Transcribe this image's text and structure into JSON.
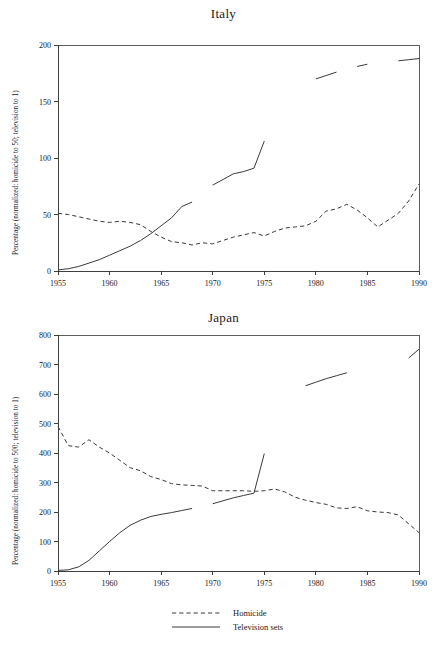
{
  "chart_data": [
    {
      "type": "line",
      "title": "Italy",
      "xlabel": "",
      "ylabel": "Percentage (normalized: homicide to 50; television to 1)",
      "xlim": [
        1955,
        1990
      ],
      "ylim": [
        0,
        200
      ],
      "xticks": [
        1955,
        1960,
        1965,
        1970,
        1975,
        1980,
        1985,
        1990
      ],
      "yticks": [
        0,
        50,
        100,
        150,
        200
      ],
      "grid": false,
      "legend_position": "bottom-shared",
      "series": [
        {
          "name": "Homicide",
          "style": "dashed",
          "x": [
            1955,
            1956,
            1957,
            1958,
            1959,
            1960,
            1961,
            1962,
            1963,
            1964,
            1965,
            1966,
            1967,
            1968,
            1969,
            1970,
            1971,
            1972,
            1973,
            1974,
            1975,
            1976,
            1977,
            1978,
            1979,
            1980,
            1981,
            1982,
            1983,
            1984,
            1985,
            1986,
            1987,
            1988,
            1989,
            1990
          ],
          "y": [
            51,
            50,
            48,
            46,
            44,
            43,
            44,
            43,
            41,
            35,
            30,
            26,
            25,
            23,
            25,
            24,
            27,
            30,
            32,
            34,
            31,
            35,
            38,
            39,
            40,
            44,
            53,
            55,
            59,
            54,
            47,
            39,
            45,
            51,
            62,
            77
          ]
        },
        {
          "name": "Television sets",
          "style": "solid",
          "segments": [
            {
              "x": [
                1955,
                1956,
                1957,
                1958,
                1959,
                1960,
                1961,
                1962,
                1963,
                1964,
                1965,
                1966,
                1967,
                1968
              ],
              "y": [
                1,
                2,
                4,
                7,
                10,
                14,
                18,
                22,
                27,
                33,
                40,
                47,
                57,
                61
              ]
            },
            {
              "x": [
                1970,
                1971,
                1972,
                1973,
                1974,
                1975
              ],
              "y": [
                76,
                81,
                86,
                88,
                91,
                115
              ]
            },
            {
              "x": [
                1980,
                1981,
                1982
              ],
              "y": [
                170,
                173,
                176
              ]
            },
            {
              "x": [
                1984,
                1985
              ],
              "y": [
                181,
                183
              ]
            },
            {
              "x": [
                1988,
                1989,
                1990
              ],
              "y": [
                186,
                187,
                188
              ]
            }
          ]
        }
      ]
    },
    {
      "type": "line",
      "title": "Japan",
      "xlabel": "",
      "ylabel": "Percentage (normalized: homicide to 500; television to 1)",
      "xlim": [
        1955,
        1990
      ],
      "ylim": [
        0,
        800
      ],
      "xticks": [
        1955,
        1960,
        1965,
        1970,
        1975,
        1980,
        1985,
        1990
      ],
      "yticks": [
        0,
        100,
        200,
        300,
        400,
        500,
        600,
        700,
        800
      ],
      "grid": false,
      "legend_position": "bottom-shared",
      "series": [
        {
          "name": "Homicide",
          "style": "dashed",
          "x": [
            1955,
            1956,
            1957,
            1958,
            1959,
            1960,
            1961,
            1962,
            1963,
            1964,
            1965,
            1966,
            1967,
            1968,
            1969,
            1970,
            1971,
            1972,
            1973,
            1974,
            1975,
            1976,
            1977,
            1978,
            1979,
            1980,
            1981,
            1982,
            1983,
            1984,
            1985,
            1986,
            1987,
            1988,
            1989,
            1990
          ],
          "y": [
            490,
            425,
            420,
            445,
            420,
            400,
            375,
            350,
            340,
            320,
            310,
            296,
            292,
            290,
            288,
            272,
            272,
            272,
            272,
            270,
            272,
            278,
            268,
            250,
            240,
            232,
            226,
            214,
            212,
            218,
            204,
            200,
            198,
            190,
            160,
            130
          ]
        },
        {
          "name": "Television sets",
          "style": "solid",
          "segments": [
            {
              "x": [
                1955,
                1956,
                1957,
                1958,
                1959,
                1960,
                1961,
                1962,
                1963,
                1964,
                1965,
                1966,
                1967,
                1968
              ],
              "y": [
                2,
                4,
                14,
                36,
                68,
                100,
                130,
                155,
                172,
                185,
                192,
                198,
                205,
                212
              ]
            },
            {
              "x": [
                1970,
                1971,
                1972,
                1973,
                1974,
                1975
              ],
              "y": [
                228,
                238,
                248,
                256,
                264,
                398
              ]
            },
            {
              "x": [
                1979,
                1980,
                1981,
                1982,
                1983
              ],
              "y": [
                628,
                640,
                652,
                662,
                672
              ]
            },
            {
              "x": [
                1989,
                1990
              ],
              "y": [
                722,
                752
              ]
            }
          ]
        }
      ]
    }
  ],
  "legend": {
    "entries": [
      {
        "label": "Homicide",
        "style": "dashed"
      },
      {
        "label": "Television sets",
        "style": "solid"
      }
    ]
  }
}
